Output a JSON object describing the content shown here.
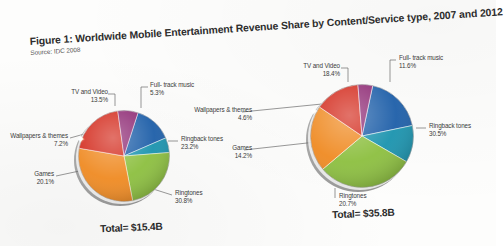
{
  "figure": {
    "title": "Figure 1: Worldwide Mobile Entertainment Revenue Share by Content/Service type, 2007 and 2012",
    "source": "Source: IDC 2008"
  },
  "colors": {
    "tv_and_video": "#1d5ea8",
    "full_track_music": "#1a93ae",
    "ringback_tones": "#8cbf3f",
    "ringtones": "#ef8a22",
    "games": "#d32a1c",
    "wallpapers_and_themes": "#8e2a74"
  },
  "charts": [
    {
      "id": "chart-2007",
      "total_label": "Total= $15.4B",
      "labels": {
        "tv_and_video": "TV and Video",
        "tv_and_video_pct": "13.5%",
        "full_track_music": "Full- track music",
        "full_track_music_pct": "5.3%",
        "ringback_tones": "Ringback tones",
        "ringback_tones_pct": "23.2%",
        "ringtones": "Ringtones",
        "ringtones_pct": "30.8%",
        "games": "Games",
        "games_pct": "20.1%",
        "wallpapers": "Wallpapers & themes",
        "wallpapers_pct": "7.2%"
      }
    },
    {
      "id": "chart-2012",
      "total_label": "Total= $35.8B",
      "labels": {
        "tv_and_video": "TV and Video",
        "tv_and_video_pct": "18.4%",
        "full_track_music": "Full- track music",
        "full_track_music_pct": "11.6%",
        "ringback_tones": "Ringback tones",
        "ringback_tones_pct": "30.5%",
        "ringtones": "Ringtones",
        "ringtones_pct": "20.7%",
        "games": "Games",
        "games_pct": "14.2%",
        "wallpapers": "Wallpapers & themes",
        "wallpapers_pct": "4.6%"
      }
    }
  ],
  "chart_data": [
    {
      "type": "pie",
      "title": "Worldwide Mobile Entertainment Revenue Share by Content/Service type, 2007",
      "subtitle": "Total= $15.4B",
      "total": 15.4,
      "total_units": "USD billions",
      "categories": [
        "TV and Video",
        "Full- track music",
        "Ringback tones",
        "Ringtones",
        "Games",
        "Wallpapers & themes"
      ],
      "values": [
        13.5,
        5.3,
        23.2,
        30.8,
        20.1,
        7.2
      ],
      "value_units": "percent",
      "colors": [
        "#1d5ea8",
        "#1a93ae",
        "#8cbf3f",
        "#ef8a22",
        "#d32a1c",
        "#8e2a74"
      ],
      "legend": "labels with leader lines",
      "grid": false
    },
    {
      "type": "pie",
      "title": "Worldwide Mobile Entertainment Revenue Share by Content/Service type, 2012",
      "subtitle": "Total= $35.8B",
      "total": 35.8,
      "total_units": "USD billions",
      "categories": [
        "TV and Video",
        "Full- track music",
        "Ringback tones",
        "Ringtones",
        "Games",
        "Wallpapers & themes"
      ],
      "values": [
        18.4,
        11.6,
        30.5,
        20.7,
        14.2,
        4.6
      ],
      "value_units": "percent",
      "colors": [
        "#1d5ea8",
        "#1a93ae",
        "#8cbf3f",
        "#ef8a22",
        "#d32a1c",
        "#8e2a74"
      ],
      "legend": "labels with leader lines",
      "grid": false
    }
  ]
}
